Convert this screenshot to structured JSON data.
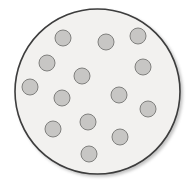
{
  "diagram": {
    "background": "#ffffff",
    "dish": {
      "cx": 97.5,
      "cy": 91.5,
      "r": 82.5,
      "fill": "#f2f1ef",
      "stroke": "#3d3d3d",
      "stroke_width": 1.6,
      "shadow_color": "#c9c9c9"
    },
    "dot_style": {
      "r": 8,
      "fill": "#c7c6c4",
      "stroke": "#80807e",
      "stroke_width": 1
    },
    "dot_count": 14,
    "dots": [
      {
        "cx": 63,
        "cy": 38
      },
      {
        "cx": 106,
        "cy": 42
      },
      {
        "cx": 138,
        "cy": 36
      },
      {
        "cx": 47,
        "cy": 63
      },
      {
        "cx": 143,
        "cy": 67
      },
      {
        "cx": 82,
        "cy": 76
      },
      {
        "cx": 30,
        "cy": 87
      },
      {
        "cx": 62,
        "cy": 98
      },
      {
        "cx": 119,
        "cy": 95
      },
      {
        "cx": 148,
        "cy": 109
      },
      {
        "cx": 88,
        "cy": 122
      },
      {
        "cx": 53,
        "cy": 129
      },
      {
        "cx": 120,
        "cy": 137
      },
      {
        "cx": 89,
        "cy": 154
      }
    ]
  }
}
